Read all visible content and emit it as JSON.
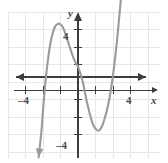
{
  "figure": {
    "kind": "coordinate-graph",
    "background_color": "#ffffff",
    "grid_color": "#e8e6e4",
    "axis_color": "#3d3d3d",
    "curve_color": "#9a9a9a",
    "label_color": "#4a4a4a"
  },
  "labels": {
    "x_axis_name": "x",
    "y_axis_name": "y",
    "x_tick_neg4": "–4",
    "x_tick_4": "4",
    "y_tick_4": "4",
    "y_tick_neg4": "–4"
  },
  "chart_data": {
    "type": "line",
    "title": "",
    "xlabel": "x",
    "ylabel": "y",
    "xlim": [
      -5,
      5
    ],
    "ylim": [
      -5,
      5
    ],
    "grid": true,
    "grid_step": 1,
    "legend": "none",
    "x_ticks": [
      -4,
      4
    ],
    "x_tick_labels": [
      "–4",
      "4"
    ],
    "y_ticks": [
      4,
      -4
    ],
    "y_tick_labels": [
      "4",
      "–4"
    ],
    "axis_arrows": [
      "left",
      "right",
      "up"
    ],
    "curve_arrows": [
      "down-left",
      "up-right"
    ],
    "series": [
      {
        "name": "cubic",
        "description": "cubic polynomial with local maximum near (-1, 3), local minimum near (1.2, -3)",
        "features": {
          "local_max": [
            -1.0,
            3.0
          ],
          "local_min": [
            1.2,
            -3.0
          ],
          "x_intercepts": [
            -1.9,
            0.2,
            2.2
          ],
          "y_intercept": 0.6
        },
        "points": [
          [
            -2.25,
            -4.6
          ],
          [
            -2.1,
            -3.2
          ],
          [
            -2.0,
            -1.9
          ],
          [
            -1.9,
            -0.7
          ],
          [
            -1.8,
            0.3
          ],
          [
            -1.7,
            1.1
          ],
          [
            -1.6,
            1.8
          ],
          [
            -1.5,
            2.3
          ],
          [
            -1.4,
            2.65
          ],
          [
            -1.3,
            2.9
          ],
          [
            -1.2,
            3.0
          ],
          [
            -1.1,
            3.05
          ],
          [
            -1.0,
            3.0
          ],
          [
            -0.9,
            2.9
          ],
          [
            -0.8,
            2.7
          ],
          [
            -0.7,
            2.4
          ],
          [
            -0.6,
            2.1
          ],
          [
            -0.5,
            1.8
          ],
          [
            -0.4,
            1.5
          ],
          [
            -0.3,
            1.2
          ],
          [
            -0.2,
            0.95
          ],
          [
            -0.1,
            0.75
          ],
          [
            0.0,
            0.6
          ],
          [
            0.1,
            0.3
          ],
          [
            0.2,
            0.0
          ],
          [
            0.3,
            -0.4
          ],
          [
            0.4,
            -0.9
          ],
          [
            0.5,
            -1.4
          ],
          [
            0.6,
            -1.8
          ],
          [
            0.7,
            -2.2
          ],
          [
            0.8,
            -2.55
          ],
          [
            0.9,
            -2.8
          ],
          [
            1.0,
            -2.95
          ],
          [
            1.1,
            -3.05
          ],
          [
            1.2,
            -3.05
          ],
          [
            1.3,
            -2.95
          ],
          [
            1.4,
            -2.75
          ],
          [
            1.5,
            -2.45
          ],
          [
            1.6,
            -2.1
          ],
          [
            1.7,
            -1.7
          ],
          [
            1.8,
            -1.2
          ],
          [
            1.9,
            -0.6
          ],
          [
            2.0,
            0.1
          ],
          [
            2.1,
            0.9
          ],
          [
            2.2,
            1.8
          ],
          [
            2.3,
            2.8
          ],
          [
            2.4,
            3.9
          ],
          [
            2.5,
            5.0
          ]
        ]
      }
    ]
  }
}
